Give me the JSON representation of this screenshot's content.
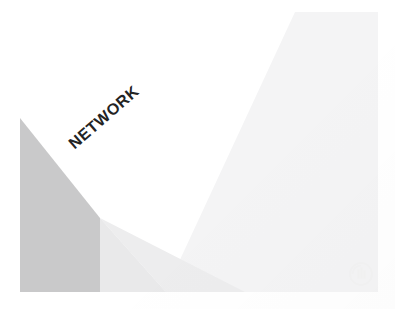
{
  "slide": {
    "title_text": "NETWORK",
    "background_color": "#ffffff",
    "canvas": {
      "width": 395,
      "height": 309
    }
  },
  "shapes": [
    {
      "name": "dark-triangle",
      "color": "#c9c9ca",
      "points": "20,118 100,218 100,292 20,292"
    },
    {
      "name": "mid-light-triangle",
      "color": "#e9e9ea",
      "points": "100,218 166,292 20,292"
    },
    {
      "name": "mid-light-triangle-right",
      "color": "#ededee",
      "points": "100,218 245,292 166,292"
    },
    {
      "name": "light-diagonal-wedge",
      "color": "#f4f4f5",
      "points": "295,12 378,12 378,292 165,292"
    }
  ],
  "headline": {
    "text": "NETWORK",
    "color": "#232323",
    "rotation_degrees": -41
  },
  "watermark": {
    "name": "circle-bars-logo",
    "color": "#f1f1f2"
  }
}
